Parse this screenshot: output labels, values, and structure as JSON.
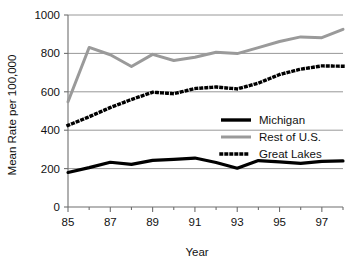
{
  "chart_data": {
    "type": "line",
    "title": "",
    "xlabel": "Year",
    "ylabel": "Mean Rate per 100,000",
    "xlim": [
      85,
      98
    ],
    "ylim": [
      0,
      1000
    ],
    "grid": true,
    "grid_axis": "y",
    "legend_position": "center-right",
    "x": [
      85,
      86,
      87,
      88,
      89,
      90,
      91,
      92,
      93,
      94,
      95,
      96,
      97,
      98
    ],
    "xtick_values": [
      85,
      87,
      89,
      91,
      93,
      95,
      97
    ],
    "xtick_labels": [
      "85",
      "87",
      "89",
      "91",
      "93",
      "95",
      "97"
    ],
    "ytick_values": [
      0,
      200,
      400,
      600,
      800,
      1000
    ],
    "ytick_labels": [
      "0",
      "200",
      "400",
      "600",
      "800",
      "1000"
    ],
    "series": [
      {
        "name": "Michigan",
        "color": "#000000",
        "style": "solid",
        "width": 3.2,
        "values": [
          180,
          205,
          233,
          222,
          243,
          248,
          255,
          232,
          202,
          242,
          235,
          227,
          238,
          240
        ]
      },
      {
        "name": "Rest of U.S.",
        "color": "#9a9a9a",
        "style": "solid",
        "width": 3.0,
        "values": [
          548,
          831,
          793,
          732,
          795,
          763,
          780,
          806,
          799,
          830,
          862,
          886,
          882,
          925
        ]
      },
      {
        "name": "Great Lakes",
        "color": "#000000",
        "style": "dotted",
        "width": 3.4,
        "values": [
          425,
          470,
          518,
          560,
          598,
          590,
          617,
          625,
          615,
          645,
          690,
          718,
          735,
          733
        ]
      }
    ]
  },
  "legend": {
    "items": [
      {
        "label": "Michigan",
        "swatch": "solid-black"
      },
      {
        "label": "Rest of U.S.",
        "swatch": "solid-gray"
      },
      {
        "label": "Great Lakes",
        "swatch": "dotted-black"
      }
    ]
  },
  "colors": {
    "michigan": "#000000",
    "rest_of_us": "#9a9a9a",
    "great_lakes": "#000000",
    "grid": "#8c8c8c",
    "axis": "#6f6f6f",
    "background": "#ffffff"
  }
}
